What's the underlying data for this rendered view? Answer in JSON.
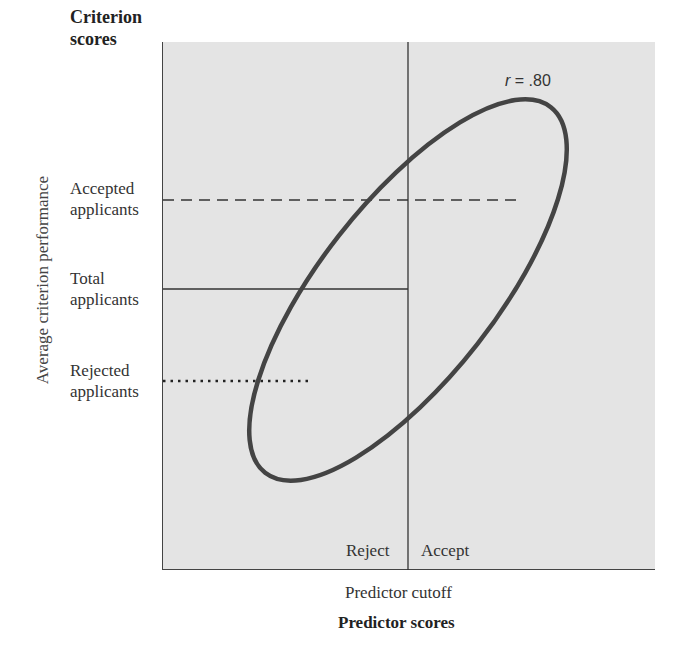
{
  "diagram": {
    "y_axis_title": "Criterion scores",
    "y_axis_label": "Average criterion performance",
    "x_axis_title": "Predictor scores",
    "x_axis_sublabel": "Predictor cutoff",
    "correlation_label_var": "r",
    "correlation_label_value": " = .80",
    "levels": [
      {
        "label_line1": "Accepted",
        "label_line2": "applicants",
        "line_style": "dashed"
      },
      {
        "label_line1": "Total",
        "label_line2": "applicants",
        "line_style": "solid"
      },
      {
        "label_line1": "Rejected",
        "label_line2": "applicants",
        "line_style": "dotted"
      }
    ],
    "regions": {
      "left": "Reject",
      "right": "Accept"
    },
    "colors": {
      "plot_background": "#e4e4e4",
      "ellipse_stroke": "#444444",
      "line_color": "#333333"
    }
  }
}
